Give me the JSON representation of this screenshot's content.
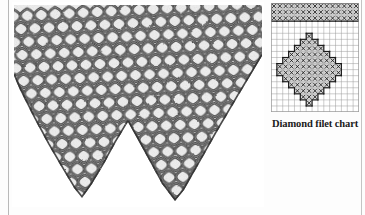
{
  "page": {
    "background_color": "#fdfdfd",
    "rule_color": "#b9b9b9"
  },
  "photo": {
    "name": "crochet-lace-edging-photo",
    "description": "Black and white photograph of a crocheted filet lace edging with two deep triangular points",
    "ink_color": "#2b2b2b",
    "mesh_color": "#555555",
    "highlight_color": "#f2f2f2",
    "points": 2,
    "point_tips_x": [
      105,
      215
    ],
    "top_edge_y": 4
  },
  "chart": {
    "caption": "Diamond filet chart",
    "name": "diamond-filet-chart",
    "columns": 15,
    "rows": 18,
    "cell_size": 5.8,
    "grid_line_color": "#9a9a9a",
    "outline_color": "#1b1b1b",
    "filled_cell_color": "#d6d6d6",
    "open_cell_color": "#ffffff",
    "mark_symbol": "x",
    "mark_color": "#1b1b1b",
    "legend": {
      "filled": "block stitch (x)",
      "open": "open mesh"
    },
    "chart_data": {
      "type": "heatmap",
      "title": "Diamond filet chart",
      "xlabel": "",
      "ylabel": "",
      "grid": true,
      "legend_position": "none",
      "columns": 15,
      "rows": 18,
      "categories": [
        "1",
        "2",
        "3",
        "4",
        "5",
        "6",
        "7",
        "8",
        "9",
        "10",
        "11",
        "12",
        "13",
        "14",
        "15"
      ],
      "row_labels": [
        "1",
        "2",
        "3",
        "4",
        "5",
        "6",
        "7",
        "8",
        "9",
        "10",
        "11",
        "12",
        "13",
        "14",
        "15",
        "16",
        "17",
        "18"
      ],
      "values": [
        [
          1,
          1,
          1,
          1,
          1,
          1,
          1,
          1,
          1,
          1,
          1,
          1,
          1,
          1,
          1
        ],
        [
          1,
          1,
          1,
          1,
          1,
          1,
          1,
          1,
          1,
          1,
          1,
          1,
          1,
          1,
          1
        ],
        [
          1,
          1,
          1,
          1,
          1,
          1,
          1,
          1,
          1,
          1,
          1,
          1,
          1,
          1,
          1
        ],
        [
          0,
          0,
          0,
          0,
          0,
          0,
          0,
          0,
          0,
          0,
          0,
          0,
          0,
          0,
          0
        ],
        [
          0,
          0,
          0,
          0,
          0,
          0,
          0,
          0,
          0,
          0,
          0,
          0,
          0,
          0,
          0
        ],
        [
          0,
          0,
          0,
          0,
          0,
          0,
          1,
          0,
          0,
          0,
          0,
          0,
          0,
          0,
          0
        ],
        [
          0,
          0,
          0,
          0,
          0,
          1,
          1,
          1,
          0,
          0,
          0,
          0,
          0,
          0,
          0
        ],
        [
          0,
          0,
          0,
          0,
          1,
          1,
          1,
          1,
          1,
          0,
          0,
          0,
          0,
          0,
          0
        ],
        [
          0,
          0,
          0,
          1,
          1,
          1,
          1,
          1,
          1,
          1,
          0,
          0,
          0,
          0,
          0
        ],
        [
          0,
          0,
          1,
          1,
          1,
          1,
          1,
          1,
          1,
          1,
          1,
          0,
          0,
          0,
          0
        ],
        [
          0,
          1,
          1,
          1,
          1,
          1,
          1,
          1,
          1,
          1,
          1,
          1,
          0,
          0,
          0
        ],
        [
          0,
          1,
          1,
          1,
          1,
          1,
          1,
          1,
          1,
          1,
          1,
          1,
          0,
          0,
          0
        ],
        [
          0,
          0,
          1,
          1,
          1,
          1,
          1,
          1,
          1,
          1,
          1,
          0,
          0,
          0,
          0
        ],
        [
          0,
          0,
          0,
          1,
          1,
          1,
          1,
          1,
          1,
          1,
          0,
          0,
          0,
          0,
          0
        ],
        [
          0,
          0,
          0,
          0,
          1,
          1,
          1,
          1,
          1,
          0,
          0,
          0,
          0,
          0,
          0
        ],
        [
          0,
          0,
          0,
          0,
          0,
          1,
          1,
          1,
          0,
          0,
          0,
          0,
          0,
          0,
          0
        ],
        [
          0,
          0,
          0,
          0,
          0,
          0,
          1,
          0,
          0,
          0,
          0,
          0,
          0,
          0,
          0
        ],
        [
          0,
          0,
          0,
          0,
          0,
          0,
          0,
          0,
          0,
          0,
          0,
          0,
          0,
          0,
          0
        ]
      ]
    }
  }
}
